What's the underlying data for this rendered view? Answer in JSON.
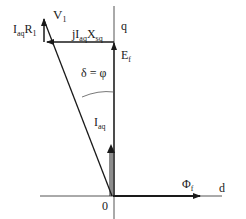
{
  "diagram": {
    "type": "phasor-diagram",
    "axes": {
      "q_label": "q",
      "d_label": "d",
      "origin_label": "0"
    },
    "labels": {
      "V1": {
        "main": "V",
        "sub": "1"
      },
      "IaqR1": {
        "main1": "I",
        "sub1": "aq",
        "main2": "R",
        "sub2": "1"
      },
      "jIaqXsq": {
        "main1": "jI",
        "sub1": "aq",
        "main2": "X",
        "sub2": "sq"
      },
      "Ef": {
        "main": "E",
        "sub": "f"
      },
      "angle": "δ = φ",
      "Iaq": {
        "main": "I",
        "sub": "aq"
      },
      "Phif": {
        "main": "Φ",
        "sub": "f"
      }
    },
    "colors": {
      "line": "#1a1a1a",
      "axis": "#555555"
    }
  }
}
